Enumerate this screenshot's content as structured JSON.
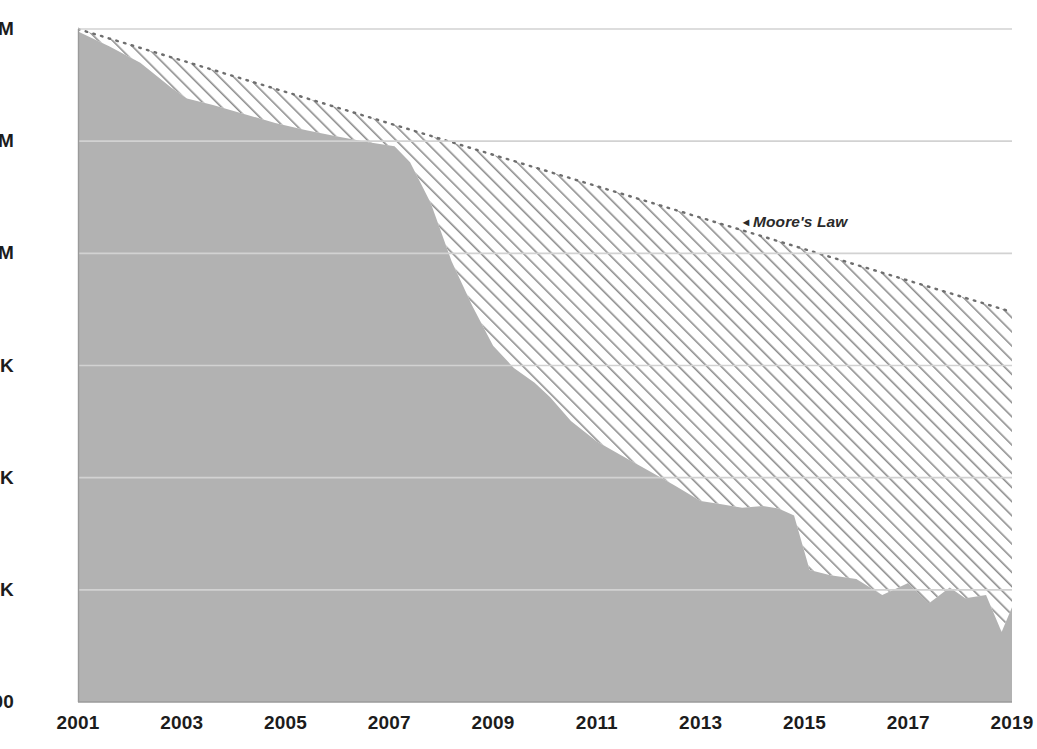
{
  "chart_data": {
    "type": "area",
    "title": "",
    "subtitle": "",
    "xlabel": "",
    "ylabel": "",
    "yscale": "log",
    "ylim": [
      100,
      100000000
    ],
    "xlim": [
      2001,
      2019
    ],
    "grid": true,
    "legend_position": "none",
    "y_tick_labels": [
      "$100M",
      "$10M",
      "$1M",
      "$100K",
      "$10K",
      "$1K",
      "$100"
    ],
    "y_tick_values": [
      100000000,
      10000000,
      1000000,
      100000,
      10000,
      1000,
      100
    ],
    "x_tick_labels": [
      "2001",
      "2003",
      "2005",
      "2007",
      "2009",
      "2011",
      "2013",
      "2015",
      "2017",
      "2019"
    ],
    "x_tick_values": [
      2001,
      2003,
      2005,
      2007,
      2009,
      2011,
      2013,
      2015,
      2017,
      2019
    ],
    "annotations": [
      {
        "text": "Moore's Law",
        "marker": "◂",
        "x": 2014.2,
        "y": 1900000
      }
    ],
    "series": [
      {
        "name": "Actual cost",
        "style": "solid-area",
        "color": "#b2b2b2",
        "x": [
          2001.0,
          2001.6,
          2002.2,
          2002.8,
          2003.1,
          2003.6,
          2004.2,
          2004.8,
          2005.4,
          2006.0,
          2006.6,
          2007.1,
          2007.4,
          2007.8,
          2008.2,
          2008.6,
          2009.0,
          2009.4,
          2009.8,
          2010.1,
          2010.5,
          2011.0,
          2011.5,
          2012.0,
          2012.5,
          2013.0,
          2013.4,
          2013.8,
          2014.2,
          2014.5,
          2014.8,
          2015.1,
          2015.5,
          2016.0,
          2016.5,
          2017.0,
          2017.4,
          2017.8,
          2018.1,
          2018.5,
          2018.8,
          2019.0
        ],
        "y": [
          95000000,
          70000000,
          50000000,
          30000000,
          24000000,
          21000000,
          17500000,
          14500000,
          12500000,
          11000000,
          9800000,
          9000000,
          6500000,
          2800000,
          850000,
          340000,
          150000,
          95000,
          70000,
          52000,
          32000,
          21000,
          15500,
          11500,
          8500,
          6200,
          5800,
          5400,
          5600,
          5300,
          4600,
          1500,
          1350,
          1250,
          900,
          1150,
          760,
          1050,
          840,
          900,
          420,
          700
        ]
      },
      {
        "name": "Moore's Law",
        "style": "hatched-area",
        "color": "#808080",
        "x": [
          2001.0,
          2019.0
        ],
        "y": [
          100000000,
          300000
        ]
      }
    ]
  },
  "axes": {
    "y_label_color": "#1c1c1c",
    "x_label_color": "#1c1c1c",
    "gridline_color": "#d2d2d2",
    "baseline_color": "#9a9a9a"
  },
  "colors": {
    "background": "#ffffff",
    "area_fill": "#b2b2b2",
    "hatch_stroke": "#8d8d8d",
    "annotation_text": "#2a2a2a"
  }
}
